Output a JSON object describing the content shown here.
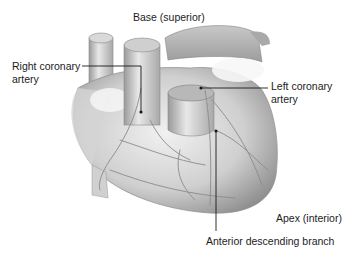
{
  "diagram": {
    "labels": {
      "base": "Base (superior)",
      "right_coronary_line1": "Right coronary",
      "right_coronary_line2": "artery",
      "left_coronary_line1": "Left coronary",
      "left_coronary_line2": "artery",
      "apex": "Apex (interior)",
      "anterior_descending": "Anterior descending branch"
    },
    "colors": {
      "background": "#ffffff",
      "illustration_light": "#e6e6e6",
      "illustration_mid": "#bdbdbd",
      "illustration_dark": "#7a7a7a",
      "leader_line": "#1a1a1a",
      "text": "#1c1c1c"
    }
  }
}
